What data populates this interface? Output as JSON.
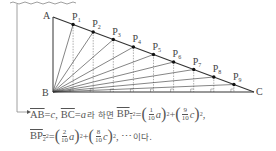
{
  "figure": {
    "vertices": {
      "A": {
        "label": "A",
        "x": 53,
        "y": 17
      },
      "B": {
        "label": "B",
        "x": 53,
        "y": 92
      },
      "C": {
        "label": "C",
        "x": 254,
        "y": 92
      }
    },
    "points": [
      {
        "label": "P",
        "sub": "1"
      },
      {
        "label": "P",
        "sub": "2"
      },
      {
        "label": "P",
        "sub": "3"
      },
      {
        "label": "P",
        "sub": "4"
      },
      {
        "label": "P",
        "sub": "5"
      },
      {
        "label": "P",
        "sub": "6"
      },
      {
        "label": "P",
        "sub": "7"
      },
      {
        "label": "P",
        "sub": "8"
      },
      {
        "label": "P",
        "sub": "9"
      }
    ],
    "colors": {
      "line": "#333333",
      "dashed": "#777777",
      "text": "#555555"
    }
  },
  "explanation": {
    "line1": {
      "ab": "AB",
      "eq1": "=",
      "c": "c",
      "comma": ",",
      "bc": "BC",
      "eq2": "=",
      "a": "a",
      "ko1": "라 하면",
      "bp1": "BP",
      "bp1_sub": "1",
      "sq": "2",
      "eq3": "=",
      "f1_num": "1",
      "f1_den": "10",
      "f1_var": "a",
      "plus": "+",
      "f2_num": "9",
      "f2_den": "10",
      "f2_var": "c",
      "end": ","
    },
    "line2": {
      "bp2": "BP",
      "bp2_sub": "2",
      "sq": "2",
      "eq": "=",
      "f1_num": "2",
      "f1_den": "10",
      "f1_var": "a",
      "plus": "+",
      "f2_num": "8",
      "f2_den": "10",
      "f2_var": "c",
      "end": ", ⋯",
      "ko": "이다."
    }
  }
}
